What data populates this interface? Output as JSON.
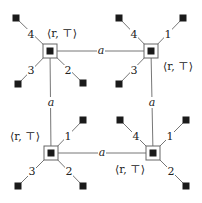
{
  "diagram": {
    "title": "",
    "colors": {
      "line": "#666666",
      "fill": "#1a1a1a",
      "text": "#222222",
      "background": "#ffffff"
    },
    "nodes": [
      {
        "id": "n1",
        "x": 50,
        "y": 51,
        "label": "⟨r, ⊤⟩",
        "label_x": 62,
        "label_y": 37,
        "label_anchor": "middle",
        "ports": [
          {
            "label": "4",
            "leaf_x": 16,
            "leaf_y": 18,
            "label_x": 31,
            "label_y": 38
          },
          {
            "label": "3",
            "leaf_x": 18,
            "leaf_y": 84,
            "label_x": 31,
            "label_y": 74
          },
          {
            "label": "2",
            "leaf_x": 83,
            "leaf_y": 83,
            "label_x": 68,
            "label_y": 74
          }
        ]
      },
      {
        "id": "n2",
        "x": 151,
        "y": 51,
        "label": "⟨r, ⊤⟩",
        "label_x": 178,
        "label_y": 70,
        "label_anchor": "middle",
        "ports": [
          {
            "label": "4",
            "leaf_x": 119,
            "leaf_y": 18,
            "label_x": 134,
            "label_y": 38
          },
          {
            "label": "1",
            "leaf_x": 183,
            "leaf_y": 18,
            "label_x": 168,
            "label_y": 38
          },
          {
            "label": "3",
            "leaf_x": 119,
            "leaf_y": 84,
            "label_x": 134,
            "label_y": 74
          }
        ]
      },
      {
        "id": "n3",
        "x": 51,
        "y": 153,
        "label": "⟨r, ⊤⟩",
        "label_x": 25,
        "label_y": 140,
        "label_anchor": "middle",
        "ports": [
          {
            "label": "1",
            "leaf_x": 83,
            "leaf_y": 120,
            "label_x": 68,
            "label_y": 140
          },
          {
            "label": "3",
            "leaf_x": 18,
            "leaf_y": 186,
            "label_x": 32,
            "label_y": 175
          },
          {
            "label": "2",
            "leaf_x": 83,
            "leaf_y": 186,
            "label_x": 69,
            "label_y": 175
          }
        ]
      },
      {
        "id": "n4",
        "x": 153,
        "y": 153,
        "label": "⟨r, ⊤⟩",
        "label_x": 130,
        "label_y": 173,
        "label_anchor": "middle",
        "ports": [
          {
            "label": "4",
            "leaf_x": 120,
            "leaf_y": 120,
            "label_x": 136,
            "label_y": 140
          },
          {
            "label": "1",
            "leaf_x": 186,
            "leaf_y": 120,
            "label_x": 170,
            "label_y": 140
          },
          {
            "label": "2",
            "leaf_x": 186,
            "leaf_y": 186,
            "label_x": 171,
            "label_y": 175
          }
        ]
      }
    ],
    "edges": [
      {
        "from": "n1",
        "to": "n2",
        "label": "a",
        "label_x": 101,
        "label_y": 54
      },
      {
        "from": "n1",
        "to": "n3",
        "label": "a",
        "label_x": 51,
        "label_y": 106
      },
      {
        "from": "n2",
        "to": "n4",
        "label": "a",
        "label_x": 152,
        "label_y": 106
      },
      {
        "from": "n3",
        "to": "n4",
        "label": "a",
        "label_x": 102,
        "label_y": 156
      }
    ]
  }
}
